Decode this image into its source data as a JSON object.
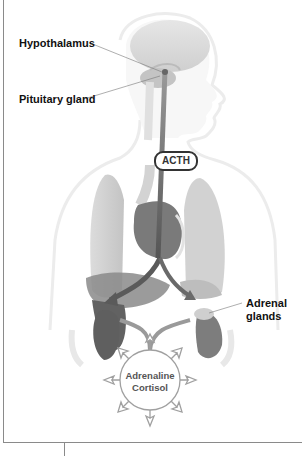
{
  "diagram": {
    "labels": {
      "hypothalamus": "Hypothalamus",
      "pituitary": "Pituitary gland",
      "acth": "ACTH",
      "adrenal_line1": "Adrenal",
      "adrenal_line2": "glands",
      "hormone_line1": "Adrenaline",
      "hormone_line2": "Cortisol"
    },
    "colors": {
      "arrow": "#555555",
      "organ_dark": "#6e6e6e",
      "organ_light": "#c8c8c8",
      "outline": "#e4e4e4",
      "leader_line": "#666666",
      "burst_outline": "#999999"
    }
  }
}
